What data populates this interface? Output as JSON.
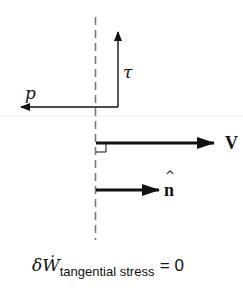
{
  "diagram": {
    "labels": {
      "tau": "τ",
      "p": "p",
      "velocity": "V",
      "normal": "n"
    },
    "equation": {
      "lhs": "δẆ",
      "subscript": "tangential stress",
      "rhs": "= 0"
    },
    "colors": {
      "arrow": "#111111",
      "dashed_surface": "#777777",
      "background": "#ffffff"
    }
  }
}
